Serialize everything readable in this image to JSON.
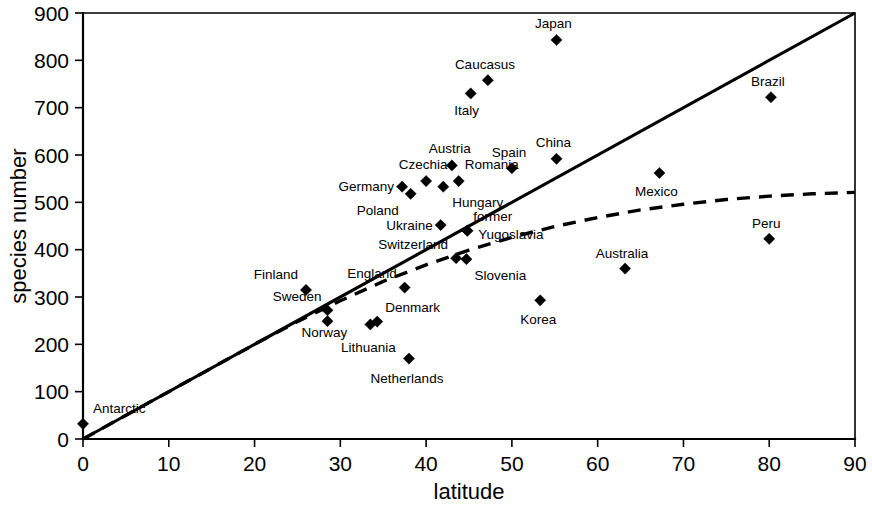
{
  "chart_data": {
    "type": "scatter",
    "title": "",
    "xlabel": "latitude",
    "ylabel": "species number",
    "xlim": [
      0,
      90
    ],
    "ylim": [
      0,
      900
    ],
    "xticks": [
      0,
      10,
      20,
      30,
      40,
      50,
      60,
      70,
      80,
      90
    ],
    "yticks": [
      0,
      100,
      200,
      300,
      400,
      500,
      600,
      700,
      800,
      900
    ],
    "grid": false,
    "legend": "none",
    "point_label_field": "label",
    "points": [
      {
        "label": "Antarctic",
        "x": 0,
        "y": 32,
        "lx": 10,
        "ly": -11,
        "anchor": "start"
      },
      {
        "label": "Finland",
        "x": 26,
        "y": 315,
        "lx": -8,
        "ly": -11,
        "anchor": "end"
      },
      {
        "label": "Sweden",
        "x": 28.5,
        "y": 272,
        "lx": -6,
        "ly": -9,
        "anchor": "end"
      },
      {
        "label": "Norway",
        "x": 28.5,
        "y": 249,
        "lx": -3,
        "ly": 16,
        "anchor": "middle"
      },
      {
        "label": "Lithuania",
        "x": 33.5,
        "y": 242,
        "lx": -2,
        "ly": 27,
        "anchor": "middle"
      },
      {
        "label": "Denmark",
        "x": 34.3,
        "y": 248,
        "lx": 8,
        "ly": -10,
        "anchor": "start"
      },
      {
        "label": "England",
        "x": 37.5,
        "y": 320,
        "lx": -8,
        "ly": -10,
        "anchor": "end"
      },
      {
        "label": "Netherlands",
        "x": 38,
        "y": 170,
        "lx": -2,
        "ly": 24,
        "anchor": "middle"
      },
      {
        "label": "Germany",
        "x": 37.2,
        "y": 533,
        "lx": -8,
        "ly": 4,
        "anchor": "end"
      },
      {
        "label": "Poland",
        "x": 38.2,
        "y": 518,
        "lx": -12,
        "ly": 21,
        "anchor": "end"
      },
      {
        "label": "Czechia",
        "x": 40,
        "y": 545,
        "lx": -3,
        "ly": -12,
        "anchor": "middle"
      },
      {
        "label": "Austria",
        "x": 43,
        "y": 578,
        "lx": -2,
        "ly": -12,
        "anchor": "middle"
      },
      {
        "label": "Hungary",
        "x": 42,
        "y": 533,
        "lx": 9,
        "ly": 20,
        "anchor": "start"
      },
      {
        "label": "Romania",
        "x": 43.8,
        "y": 545,
        "lx": 6,
        "ly": -12,
        "anchor": "start"
      },
      {
        "label": "Ukraine",
        "x": 41.7,
        "y": 452,
        "lx": -8,
        "ly": 5,
        "anchor": "end"
      },
      {
        "label": "former",
        "x": 44.8,
        "y": 440,
        "lx": 6,
        "ly": -10,
        "anchor": "start"
      },
      {
        "label": "Yugoslavia",
        "x": 44.8,
        "y": 440,
        "lx": 11,
        "ly": 8,
        "anchor": "start"
      },
      {
        "label": "Switzerland",
        "x": 43.5,
        "y": 382,
        "lx": -8,
        "ly": -9,
        "anchor": "end"
      },
      {
        "label": "Slovenia",
        "x": 44.7,
        "y": 380,
        "lx": 8,
        "ly": 21,
        "anchor": "start"
      },
      {
        "label": "Italy",
        "x": 45.2,
        "y": 730,
        "lx": -4,
        "ly": 21,
        "anchor": "middle"
      },
      {
        "label": "Caucasus",
        "x": 47.2,
        "y": 758,
        "lx": -3,
        "ly": -11,
        "anchor": "middle"
      },
      {
        "label": "Spain",
        "x": 50,
        "y": 572,
        "lx": -3,
        "ly": -11,
        "anchor": "middle"
      },
      {
        "label": "Korea",
        "x": 53.3,
        "y": 293,
        "lx": -2,
        "ly": 24,
        "anchor": "middle"
      },
      {
        "label": "China",
        "x": 55.2,
        "y": 592,
        "lx": -3,
        "ly": -12,
        "anchor": "middle"
      },
      {
        "label": "Japan",
        "x": 55.2,
        "y": 843,
        "lx": -3,
        "ly": -12,
        "anchor": "middle"
      },
      {
        "label": "Australia",
        "x": 63.2,
        "y": 360,
        "lx": -3,
        "ly": -11,
        "anchor": "middle"
      },
      {
        "label": "Mexico",
        "x": 67.2,
        "y": 562,
        "lx": -3,
        "ly": 23,
        "anchor": "middle"
      },
      {
        "label": "Peru",
        "x": 80,
        "y": 423,
        "lx": -3,
        "ly": -11,
        "anchor": "middle"
      },
      {
        "label": "Brazil",
        "x": 80.2,
        "y": 722,
        "lx": -3,
        "ly": -11,
        "anchor": "middle"
      }
    ],
    "trend_linear": {
      "style": "solid",
      "description": "linear regression line through origin",
      "x": [
        0,
        90
      ],
      "y": [
        0,
        900
      ]
    },
    "trend_curve": {
      "style": "dashed",
      "description": "saturating (asymptotic) fitted curve",
      "x": [
        0,
        10,
        20,
        25,
        30,
        35,
        40,
        45,
        50,
        55,
        60,
        65,
        70,
        75,
        80,
        85,
        90
      ],
      "y": [
        0,
        100,
        200,
        248,
        292,
        333,
        368,
        399,
        426,
        449,
        468,
        484,
        496,
        506,
        513,
        518,
        521
      ]
    }
  },
  "axis": {
    "x_title": "latitude",
    "y_title": "species number",
    "x_tick_labels": [
      "0",
      "10",
      "20",
      "30",
      "40",
      "50",
      "60",
      "70",
      "80",
      "90"
    ],
    "y_tick_labels": [
      "0",
      "100",
      "200",
      "300",
      "400",
      "500",
      "600",
      "700",
      "800",
      "900"
    ]
  },
  "colors": {
    "ink": "#000000",
    "background": "#ffffff"
  }
}
